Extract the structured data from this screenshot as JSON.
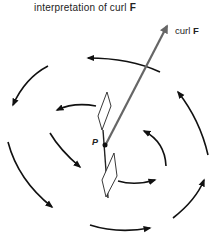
{
  "title": {
    "text": "interpretation of curl ",
    "bold": "F"
  },
  "vector_label": {
    "text": "curl ",
    "bold": "F"
  },
  "point_label": "P",
  "colors": {
    "curl_vector": "#666666",
    "arcs": "#111111",
    "paddle": "#222222",
    "background": "#ffffff"
  }
}
